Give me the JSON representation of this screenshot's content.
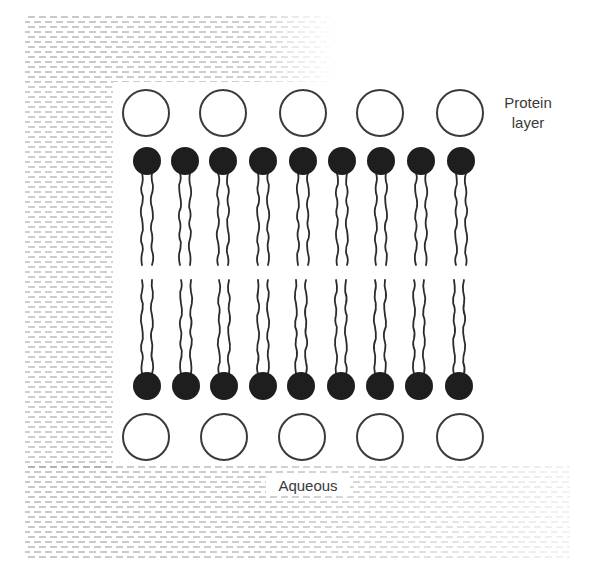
{
  "diagram": {
    "labels": {
      "protein_layer_line1": "Protein",
      "protein_layer_line2": "layer",
      "aqueous": "Aqueous"
    },
    "colors": {
      "background": "#ffffff",
      "ink": "#2b2b2b",
      "protein_stroke": "#3a3a3a",
      "lipid_head_fill": "#1e1e1e",
      "aqueous_texture": "#9a9a9a",
      "label_text": "#3a3a3a"
    },
    "protein_layer_top": {
      "shape": "open-circle",
      "count": 5,
      "centers_x": [
        146,
        223,
        303,
        380,
        460
      ],
      "center_y": 113,
      "radius": 23
    },
    "protein_layer_bottom": {
      "shape": "open-circle",
      "count": 5,
      "centers_x": [
        146,
        224,
        302,
        380,
        460
      ],
      "center_y": 437,
      "radius": 23
    },
    "lipid_layer_top": {
      "shape": "filled-head-with-two-tails",
      "count": 9,
      "heads_x": [
        147,
        185,
        223,
        263,
        303,
        342,
        381,
        421,
        461
      ],
      "head_y": 161,
      "head_radius": 14,
      "tails_end_y": 265,
      "tail_spacing": 12
    },
    "lipid_layer_bottom": {
      "shape": "filled-head-with-two-tails",
      "count": 9,
      "heads_x": [
        147,
        186,
        224,
        263,
        301,
        341,
        380,
        419,
        459
      ],
      "head_y": 386,
      "head_radius": 14,
      "tails_start_y": 280,
      "tail_spacing": 12
    },
    "aqueous_regions": [
      {
        "name": "top-band",
        "x": 25,
        "y": 16,
        "w": 310,
        "h": 66
      },
      {
        "name": "left-band",
        "x": 25,
        "y": 82,
        "w": 88,
        "h": 386
      },
      {
        "name": "bottom-band",
        "x": 25,
        "y": 466,
        "w": 545,
        "h": 92
      }
    ]
  }
}
